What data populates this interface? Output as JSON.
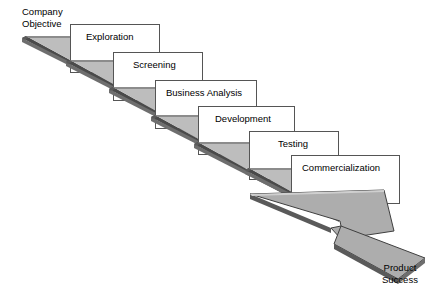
{
  "diagram": {
    "type": "descending-staircase-flow",
    "colors": {
      "background": "#ffffff",
      "ramp_fill": "#adadad",
      "ramp_edge_dark": "#4a4a4a",
      "ramp_edge_mid": "#808080",
      "box_fill": "#ffffff",
      "box_stroke": "#555555",
      "text": "#000000"
    },
    "start_label": {
      "line1": "Company",
      "line2": "Objective"
    },
    "end_label": {
      "line1": "Product",
      "line2": "Success"
    },
    "stages": [
      {
        "id": "exploration",
        "label": "Exploration"
      },
      {
        "id": "screening",
        "label": "Screening"
      },
      {
        "id": "business-analysis",
        "label": "Business Analysis"
      },
      {
        "id": "development",
        "label": "Development"
      },
      {
        "id": "testing",
        "label": "Testing"
      },
      {
        "id": "commercialization",
        "label": "Commercialization"
      }
    ]
  }
}
